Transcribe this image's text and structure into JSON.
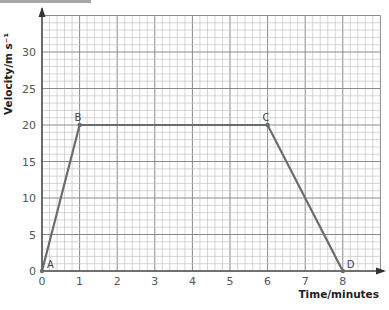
{
  "chart_data": {
    "type": "line",
    "title": "",
    "xlabel": "Time/minutes",
    "ylabel": "Velocity/m s⁻¹",
    "x_ticks": [
      0,
      1,
      2,
      3,
      4,
      5,
      6,
      7,
      8
    ],
    "y_ticks": [
      0,
      5,
      10,
      15,
      20,
      25,
      30
    ],
    "xlim": [
      0,
      9
    ],
    "ylim": [
      0,
      35
    ],
    "grid": true,
    "series": [
      {
        "name": "velocity",
        "x": [
          0,
          1,
          6,
          8
        ],
        "y": [
          0,
          20,
          20,
          0
        ],
        "point_labels": [
          "A",
          "B",
          "C",
          "D"
        ]
      }
    ],
    "colors": {
      "line": "#6b6b6b",
      "grid_major": "#8a8a8a",
      "grid_minor": "#c4c4c4",
      "axis": "#555555"
    }
  }
}
